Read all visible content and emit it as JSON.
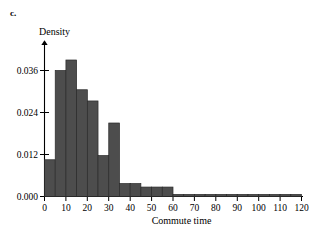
{
  "part_label": "c.",
  "axis": {
    "y_title": "Density",
    "x_title": "Commute time",
    "y_ticks": [
      "0.000",
      "0.012",
      "0.024",
      "0.036"
    ],
    "x_ticks": [
      "0",
      "10",
      "20",
      "30",
      "40",
      "50",
      "60",
      "70",
      "80",
      "90",
      "100",
      "110",
      "120"
    ]
  },
  "colors": {
    "bar_fill": "#4d4d4d",
    "bar_stroke": "#2a2a2a",
    "axis": "#000000",
    "background": "#ffffff"
  },
  "caption_fragment": "",
  "chart_data": {
    "type": "bar",
    "title": "",
    "subtitle": "",
    "xlabel": "Commute time",
    "ylabel": "Density",
    "xlim": [
      0,
      120
    ],
    "ylim": [
      0,
      0.042
    ],
    "grid": false,
    "legend": null,
    "bin_width": 5,
    "categories": [
      "0-5",
      "5-10",
      "10-15",
      "15-20",
      "20-25",
      "25-30",
      "30-35",
      "35-40",
      "40-45",
      "45-50",
      "50-55",
      "55-60",
      "60-65",
      "65-70",
      "70-75",
      "75-80",
      "80-85",
      "85-90",
      "90-95",
      "95-100",
      "100-105",
      "105-110",
      "110-115",
      "115-120"
    ],
    "bin_edges": [
      0,
      5,
      10,
      15,
      20,
      25,
      30,
      35,
      40,
      45,
      50,
      55,
      60,
      65,
      70,
      75,
      80,
      85,
      90,
      95,
      100,
      105,
      110,
      115,
      120
    ],
    "values": [
      0.0105,
      0.036,
      0.039,
      0.0305,
      0.0273,
      0.0117,
      0.021,
      0.0037,
      0.0037,
      0.0027,
      0.0027,
      0.0027,
      0.0006,
      0.0006,
      0.0006,
      0.0006,
      0.0006,
      0.0006,
      0.0006,
      0.0006,
      0.0006,
      0.0006,
      0.0006,
      0.0006
    ],
    "y_tick_values": [
      0.0,
      0.012,
      0.024,
      0.036
    ],
    "x_tick_values": [
      0,
      10,
      20,
      30,
      40,
      50,
      60,
      70,
      80,
      90,
      100,
      110,
      120
    ]
  }
}
